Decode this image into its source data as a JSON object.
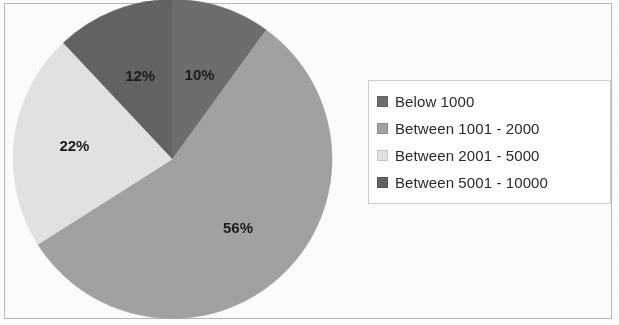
{
  "chart_data": {
    "type": "pie",
    "title": "",
    "labels": [
      "Below 1000",
      "Between 1001 - 2000",
      "Between 2001 - 5000",
      "Between 5001 - 10000"
    ],
    "values": [
      10,
      56,
      22,
      12
    ],
    "value_labels": [
      "10%",
      "56%",
      "22%",
      "12%"
    ],
    "colors": [
      "#6e6e6e",
      "#a2a2a2",
      "#e3e3e3",
      "#636363"
    ],
    "start_angle_deg": 0,
    "direction": "clockwise",
    "legend_position": "right",
    "grid": false,
    "units": "percent"
  },
  "legend": {
    "entries": [
      {
        "label": "Below 1000",
        "color": "#6e6e6e"
      },
      {
        "label": "Between 1001 - 2000",
        "color": "#a2a2a2"
      },
      {
        "label": "Between 2001 - 5000",
        "color": "#e3e3e3"
      },
      {
        "label": "Between 5001 - 10000",
        "color": "#636363"
      }
    ]
  },
  "figure": {
    "background": "#fdfdfd",
    "border_color": "#b9b9b9"
  }
}
